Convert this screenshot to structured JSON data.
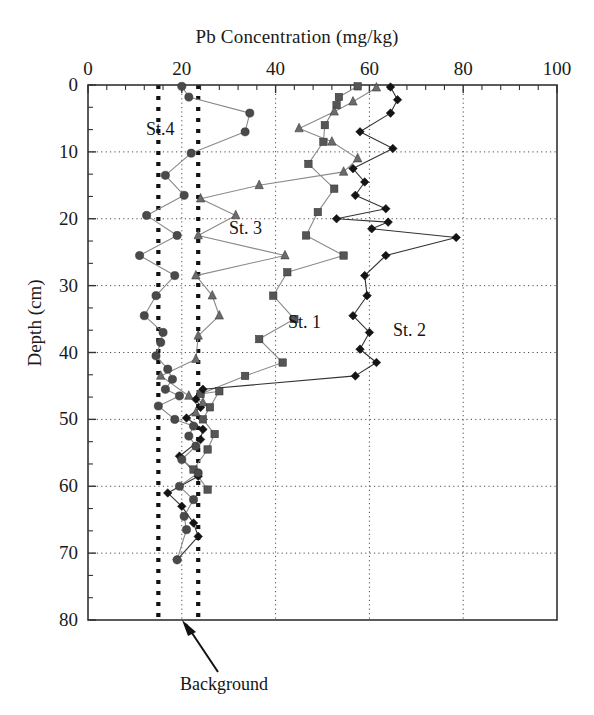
{
  "figure": {
    "title": "Pb Concentration (mg/kg)",
    "ylabel": "Depth (cm)"
  },
  "annotations": {
    "background_label": "Background",
    "background_value": 20,
    "band_low": 15,
    "band_high": 23.5
  },
  "series_labels": {
    "st4": "St.4",
    "st3": "St. 3",
    "st1": "St. 1",
    "st2": "St. 2"
  },
  "xticks": [
    "0",
    "20",
    "40",
    "60",
    "80",
    "100"
  ],
  "yticks": [
    "0",
    "10",
    "20",
    "30",
    "40",
    "50",
    "60",
    "70",
    "80"
  ],
  "chart_data": {
    "type": "line",
    "title": "Pb Concentration (mg/kg)",
    "xlabel": "Pb Concentration (mg/kg)",
    "ylabel": "Depth (cm)",
    "xlim": [
      0,
      100
    ],
    "ylim": [
      80,
      0
    ],
    "y_inverted": true,
    "grid": true,
    "legend": "inline-annotations",
    "xticks": [
      0,
      20,
      40,
      60,
      80,
      100
    ],
    "yticks": [
      0,
      10,
      20,
      30,
      40,
      50,
      60,
      70,
      80
    ],
    "reference_lines": [
      {
        "name": "background-band-low",
        "x": 15,
        "style": "heavy-dotted"
      },
      {
        "name": "background-band-high",
        "x": 23.5,
        "style": "heavy-dotted"
      }
    ],
    "series": [
      {
        "name": "St. 1",
        "marker": "square",
        "color": "#555555",
        "points": [
          {
            "x": 57.5,
            "y": 0.2
          },
          {
            "x": 53.5,
            "y": 1.8
          },
          {
            "x": 53.0,
            "y": 3.0
          },
          {
            "x": 50.5,
            "y": 6.0
          },
          {
            "x": 50.2,
            "y": 8.5
          },
          {
            "x": 47.0,
            "y": 11.8
          },
          {
            "x": 52.5,
            "y": 15.5
          },
          {
            "x": 49.0,
            "y": 19.0
          },
          {
            "x": 46.5,
            "y": 22.5
          },
          {
            "x": 54.5,
            "y": 25.5
          },
          {
            "x": 42.5,
            "y": 28.0
          },
          {
            "x": 39.5,
            "y": 31.5
          },
          {
            "x": 44.0,
            "y": 35.0
          },
          {
            "x": 36.5,
            "y": 38.0
          },
          {
            "x": 41.5,
            "y": 41.5
          },
          {
            "x": 33.5,
            "y": 43.5
          },
          {
            "x": 24.0,
            "y": 46.2
          },
          {
            "x": 28.0,
            "y": 45.8
          },
          {
            "x": 26.0,
            "y": 48.2
          },
          {
            "x": 24.5,
            "y": 50.0
          },
          {
            "x": 27.0,
            "y": 52.2
          },
          {
            "x": 25.5,
            "y": 54.5
          },
          {
            "x": 22.5,
            "y": 57.5
          },
          {
            "x": 25.5,
            "y": 60.5
          }
        ]
      },
      {
        "name": "St. 2",
        "marker": "diamond",
        "color": "#141414",
        "points": [
          {
            "x": 64.5,
            "y": 0.3
          },
          {
            "x": 66.0,
            "y": 2.2
          },
          {
            "x": 64.5,
            "y": 4.2
          },
          {
            "x": 58.0,
            "y": 7.0
          },
          {
            "x": 65.0,
            "y": 9.5
          },
          {
            "x": 56.5,
            "y": 12.5
          },
          {
            "x": 59.0,
            "y": 14.5
          },
          {
            "x": 57.0,
            "y": 16.5
          },
          {
            "x": 63.5,
            "y": 18.5
          },
          {
            "x": 53.0,
            "y": 20.0
          },
          {
            "x": 64.0,
            "y": 20.5
          },
          {
            "x": 60.5,
            "y": 21.5
          },
          {
            "x": 78.5,
            "y": 22.8
          },
          {
            "x": 63.5,
            "y": 25.5
          },
          {
            "x": 59.0,
            "y": 28.5
          },
          {
            "x": 59.5,
            "y": 31.5
          },
          {
            "x": 56.5,
            "y": 34.5
          },
          {
            "x": 60.0,
            "y": 37.0
          },
          {
            "x": 58.0,
            "y": 39.5
          },
          {
            "x": 61.5,
            "y": 41.5
          },
          {
            "x": 57.0,
            "y": 43.5
          },
          {
            "x": 24.5,
            "y": 45.5
          },
          {
            "x": 23.0,
            "y": 47.0
          },
          {
            "x": 24.0,
            "y": 48.2
          },
          {
            "x": 21.0,
            "y": 49.8
          },
          {
            "x": 24.5,
            "y": 51.5
          },
          {
            "x": 24.0,
            "y": 53.0
          },
          {
            "x": 19.5,
            "y": 55.5
          },
          {
            "x": 23.5,
            "y": 58.5
          },
          {
            "x": 17.0,
            "y": 61.0
          },
          {
            "x": 20.0,
            "y": 63.0
          },
          {
            "x": 22.5,
            "y": 65.5
          },
          {
            "x": 23.5,
            "y": 67.5
          },
          {
            "x": 19.0,
            "y": 71.0
          }
        ]
      },
      {
        "name": "St. 3",
        "marker": "triangle",
        "color": "#6b6b6b",
        "points": [
          {
            "x": 61.5,
            "y": 0.4
          },
          {
            "x": 56.5,
            "y": 2.5
          },
          {
            "x": 52.5,
            "y": 4.0
          },
          {
            "x": 45.0,
            "y": 6.5
          },
          {
            "x": 52.0,
            "y": 8.5
          },
          {
            "x": 57.5,
            "y": 11.0
          },
          {
            "x": 54.5,
            "y": 13.0
          },
          {
            "x": 36.5,
            "y": 15.0
          },
          {
            "x": 24.0,
            "y": 17.0
          },
          {
            "x": 31.5,
            "y": 19.5
          },
          {
            "x": 23.5,
            "y": 22.5
          },
          {
            "x": 42.0,
            "y": 25.5
          },
          {
            "x": 23.0,
            "y": 28.5
          },
          {
            "x": 26.5,
            "y": 31.5
          },
          {
            "x": 28.0,
            "y": 34.5
          },
          {
            "x": 23.5,
            "y": 37.5
          },
          {
            "x": 23.0,
            "y": 41.0
          },
          {
            "x": 15.5,
            "y": 43.5
          },
          {
            "x": 21.5,
            "y": 46.5
          },
          {
            "x": 24.5,
            "y": 47.5
          },
          {
            "x": 23.0,
            "y": 49.0
          }
        ]
      },
      {
        "name": "St.4",
        "marker": "circle",
        "color": "#4a4a4a",
        "points": [
          {
            "x": 20.0,
            "y": 0.2
          },
          {
            "x": 21.5,
            "y": 1.8
          },
          {
            "x": 34.5,
            "y": 4.2
          },
          {
            "x": 33.5,
            "y": 7.0
          },
          {
            "x": 22.0,
            "y": 10.2
          },
          {
            "x": 16.5,
            "y": 13.5
          },
          {
            "x": 20.5,
            "y": 16.5
          },
          {
            "x": 12.5,
            "y": 19.5
          },
          {
            "x": 19.0,
            "y": 22.5
          },
          {
            "x": 11.0,
            "y": 25.5
          },
          {
            "x": 18.5,
            "y": 28.5
          },
          {
            "x": 14.5,
            "y": 31.5
          },
          {
            "x": 12.0,
            "y": 34.5
          },
          {
            "x": 16.0,
            "y": 37.0
          },
          {
            "x": 15.5,
            "y": 38.5
          },
          {
            "x": 14.5,
            "y": 40.5
          },
          {
            "x": 17.0,
            "y": 42.5
          },
          {
            "x": 18.0,
            "y": 44.0
          },
          {
            "x": 16.5,
            "y": 45.5
          },
          {
            "x": 19.5,
            "y": 46.5
          },
          {
            "x": 15.0,
            "y": 48.0
          },
          {
            "x": 18.5,
            "y": 50.0
          },
          {
            "x": 22.5,
            "y": 51.0
          },
          {
            "x": 21.5,
            "y": 52.5
          },
          {
            "x": 23.0,
            "y": 54.0
          },
          {
            "x": 20.0,
            "y": 56.0
          },
          {
            "x": 23.5,
            "y": 58.0
          },
          {
            "x": 19.5,
            "y": 60.0
          },
          {
            "x": 22.5,
            "y": 62.0
          },
          {
            "x": 20.5,
            "y": 64.5
          },
          {
            "x": 21.0,
            "y": 66.5
          },
          {
            "x": 19.0,
            "y": 71.0
          }
        ]
      }
    ]
  }
}
